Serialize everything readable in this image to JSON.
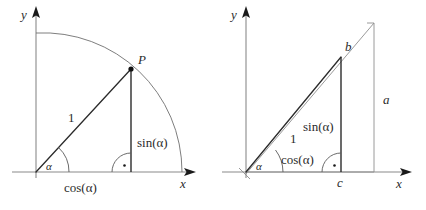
{
  "figure": {
    "title": "",
    "background_color": "#ffffff",
    "ink_color": "#2b2b2b",
    "axis_color": "#8a8a8a",
    "panels": [
      {
        "id": "unit-circle-panel",
        "name": "left-diagram-unit-circle",
        "axes": {
          "y_label": "y",
          "x_label": "x"
        },
        "labels": {
          "point": "P",
          "radius": "1",
          "angle": "α",
          "opposite": "sin(α)",
          "adjacent": "cos(α)"
        },
        "marks": {
          "right_angle": "·",
          "arc": "unit-circle-quarter-arc"
        }
      },
      {
        "id": "similar-triangles-panel",
        "name": "right-diagram-similar-triangles",
        "axes": {
          "y_label": "y",
          "x_label": "x"
        },
        "labels": {
          "angle": "α",
          "hypotenuse": "1",
          "opposite": "sin(α)",
          "adjacent": "cos(α)",
          "outer_hypotenuse_point": "b",
          "outer_opposite": "a",
          "inner_adjacent_point": "c"
        },
        "marks": {
          "right_angle": "·"
        }
      }
    ]
  }
}
